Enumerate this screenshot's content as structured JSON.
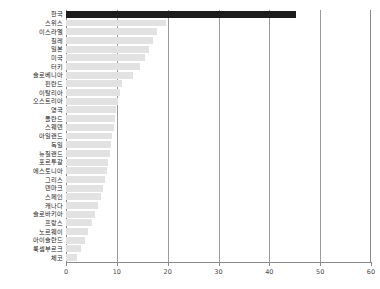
{
  "chart_data": {
    "type": "bar",
    "orientation": "horizontal",
    "title": "",
    "subtitle": "",
    "xlabel": "",
    "ylabel": "",
    "xlim": [
      0,
      60
    ],
    "xticks": [
      0,
      10,
      20,
      30,
      40,
      50,
      60
    ],
    "xtick_labels": [
      "0",
      "10",
      "20",
      "30",
      "40",
      "50",
      "60"
    ],
    "grid": true,
    "grid_axis": "x",
    "legend": false,
    "highlight_category": "한국",
    "colors": {
      "bar": "#e2e2e2",
      "highlight_bar": "#1c1c1c",
      "axis": "#8a8a8a",
      "grid": "#9a9a9a",
      "text": "#1a1a1a",
      "background": "#ffffff"
    },
    "categories": [
      "한국",
      "스위스",
      "이스라엘",
      "칠레",
      "일본",
      "미국",
      "터키",
      "슬로베니아",
      "핀란드",
      "이탈리아",
      "오스트리아",
      "영국",
      "폴란드",
      "스웨덴",
      "아일랜드",
      "독일",
      "뉴질랜드",
      "포르투갈",
      "에스토니아",
      "그리스",
      "덴마크",
      "스페인",
      "캐나다",
      "슬로바키아",
      "프랑스",
      "노르웨이",
      "아이슬란드",
      "룩셈부르크",
      "체코"
    ],
    "values": [
      45.2,
      19.6,
      17.9,
      17.2,
      16.4,
      15.6,
      14.6,
      13.1,
      11.0,
      10.6,
      10.2,
      9.9,
      9.6,
      9.4,
      9.1,
      8.9,
      8.6,
      8.3,
      8.0,
      7.6,
      7.2,
      6.8,
      6.3,
      5.7,
      5.1,
      4.4,
      3.7,
      3.0,
      2.2
    ]
  }
}
